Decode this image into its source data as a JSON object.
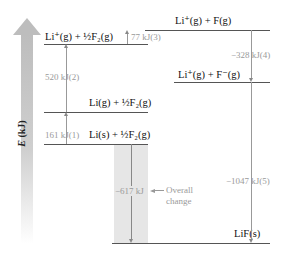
{
  "axis": {
    "label_var": "E",
    "label_unit": " (kJ)"
  },
  "levels": [
    {
      "id": "li-plus-f",
      "label": "Li⁺(g) + F(g)"
    },
    {
      "id": "li-plus-half-f2",
      "label": "Li⁺(g) + ½F₂(g)"
    },
    {
      "id": "li-plus-f-minus",
      "label": "Li⁺(g) + F⁻(g)"
    },
    {
      "id": "li-gas-half-f2",
      "label": "Li(g) + ½F₂(g)"
    },
    {
      "id": "li-solid-half-f2",
      "label": "Li(s) + ½F₂(g)"
    },
    {
      "id": "lif-solid",
      "label": "LiF(s)"
    }
  ],
  "steps": [
    {
      "id": "step1",
      "label": "161 kJ(1)"
    },
    {
      "id": "step2",
      "label": "520 kJ(2)"
    },
    {
      "id": "step3",
      "label": "77 kJ(3)"
    },
    {
      "id": "step4",
      "label": "−328 kJ(4)"
    },
    {
      "id": "step5",
      "label": "−1047 kJ(5)"
    }
  ],
  "overall": {
    "value": "−617 kJ",
    "caption_line1": "Overall",
    "caption_line2": "change"
  }
}
